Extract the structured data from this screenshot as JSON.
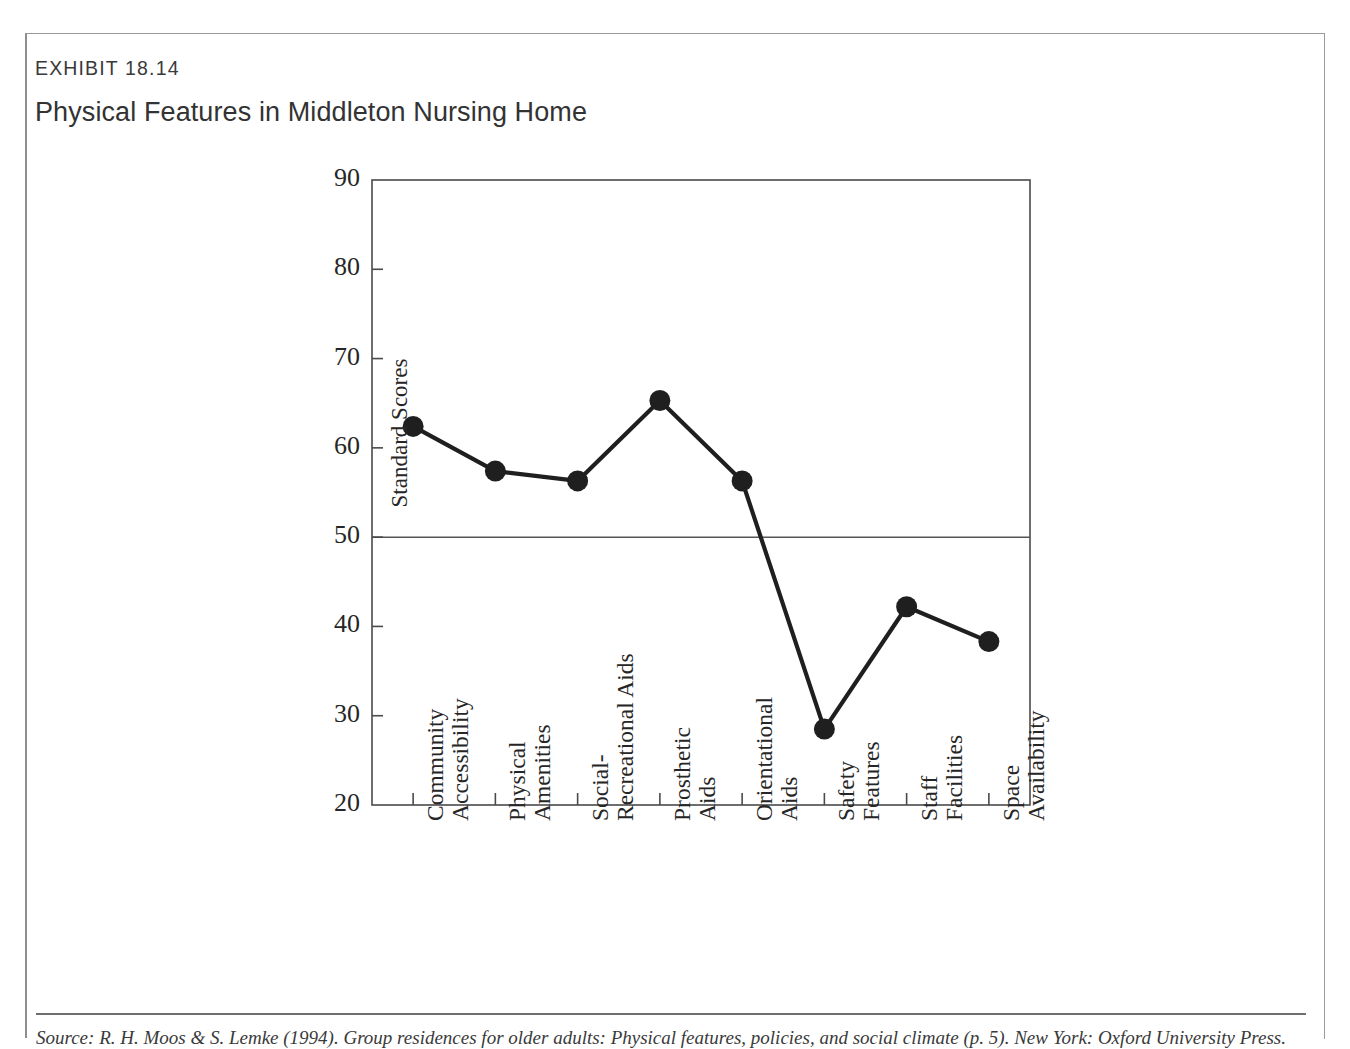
{
  "exhibit": {
    "label": "EXHIBIT 18.14",
    "title": "Physical Features in Middleton Nursing Home"
  },
  "source": {
    "text": "Source: R. H. Moos & S. Lemke (1994). Group residences for older adults: Physical features, policies, and social climate (p. 5). New York: Oxford University Press."
  },
  "chart_data": {
    "type": "line",
    "title": "Physical Features in Middleton Nursing Home",
    "xlabel": "",
    "ylabel": "Standard Scores",
    "ylim": [
      20,
      90
    ],
    "yticks": [
      20,
      30,
      40,
      50,
      60,
      70,
      80,
      90
    ],
    "grid": false,
    "legend": "none",
    "reference_line": {
      "value": 50,
      "orientation": "horizontal",
      "color": "#555555"
    },
    "marker": "filled-circle",
    "line_color": "#1f1f1f",
    "categories": [
      "Community Accessibility",
      "Physical Amenities",
      "Social-Recreational Aids",
      "Prosthetic Aids",
      "Orientational Aids",
      "Safety Features",
      "Staff Facilities",
      "Space Availability"
    ],
    "category_lines": [
      [
        "Community",
        "Accessibility"
      ],
      [
        "Physical",
        "Amenities"
      ],
      [
        "Social-",
        "Recreational Aids"
      ],
      [
        "Prosthetic",
        "Aids"
      ],
      [
        "Orientational",
        "Aids"
      ],
      [
        "Safety",
        "Features"
      ],
      [
        "Staff",
        "Facilities"
      ],
      [
        "Space",
        "Availability"
      ]
    ],
    "values": [
      62.4,
      57.4,
      56.3,
      65.3,
      56.3,
      28.5,
      42.2,
      38.3
    ]
  }
}
